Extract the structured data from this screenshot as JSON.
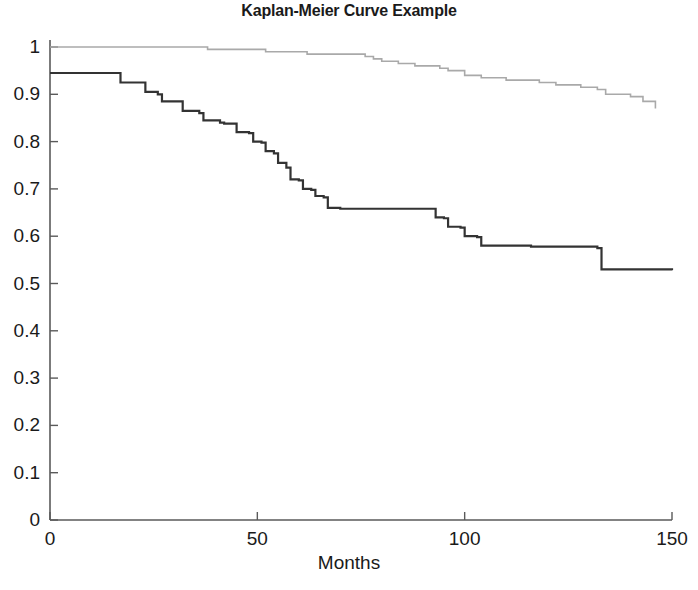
{
  "chart_data": {
    "type": "line",
    "title": "Kaplan-Meier Curve Example",
    "xlabel": "Months",
    "ylabel": "",
    "xlim": [
      0,
      150
    ],
    "ylim": [
      0,
      1
    ],
    "grid": false,
    "legend": "none",
    "step_type": "post",
    "xticks": [
      0,
      50,
      100,
      150
    ],
    "xtick_labels": [
      "0",
      "50",
      "100",
      "150"
    ],
    "yticks": [
      0,
      0.1,
      0.2,
      0.3,
      0.4,
      0.5,
      0.6,
      0.7,
      0.8,
      0.9,
      1
    ],
    "ytick_labels": [
      "0",
      "0.1",
      "0.2",
      "0.3",
      "0.4",
      "0.5",
      "0.6",
      "0.7",
      "0.8",
      "0.9",
      "1"
    ],
    "series": [
      {
        "name": "upper-curve",
        "color": "#a9a9a9",
        "width": 1.6,
        "x": [
          0,
          36,
          38,
          44,
          52,
          60,
          62,
          68,
          76,
          78,
          80,
          84,
          88,
          94,
          96,
          100,
          104,
          110,
          118,
          122,
          128,
          132,
          134,
          140,
          143,
          146
        ],
        "y": [
          1.0,
          1.0,
          0.995,
          0.995,
          0.99,
          0.99,
          0.985,
          0.985,
          0.98,
          0.975,
          0.97,
          0.965,
          0.96,
          0.955,
          0.95,
          0.94,
          0.935,
          0.93,
          0.925,
          0.92,
          0.915,
          0.91,
          0.9,
          0.895,
          0.885,
          0.87
        ]
      },
      {
        "name": "lower-curve",
        "color": "#333333",
        "width": 2.2,
        "x": [
          0,
          16,
          17,
          22,
          23,
          26,
          27,
          31,
          32,
          36,
          37,
          41,
          42,
          44,
          45,
          48,
          49,
          51,
          52,
          54,
          55,
          57,
          58,
          60,
          61,
          63,
          64,
          66,
          67,
          69,
          70,
          92,
          93,
          95,
          96,
          99,
          100,
          103,
          104,
          116,
          117,
          132,
          133,
          150
        ],
        "y": [
          0.945,
          0.945,
          0.925,
          0.925,
          0.905,
          0.9,
          0.885,
          0.885,
          0.865,
          0.86,
          0.845,
          0.84,
          0.838,
          0.838,
          0.82,
          0.818,
          0.8,
          0.798,
          0.78,
          0.775,
          0.755,
          0.745,
          0.72,
          0.718,
          0.7,
          0.698,
          0.685,
          0.682,
          0.66,
          0.66,
          0.658,
          0.658,
          0.64,
          0.638,
          0.62,
          0.618,
          0.6,
          0.598,
          0.58,
          0.578,
          0.578,
          0.575,
          0.53,
          0.528
        ]
      }
    ]
  },
  "axes": {
    "axis_color": "#5a5a5a",
    "background": "#ffffff"
  }
}
